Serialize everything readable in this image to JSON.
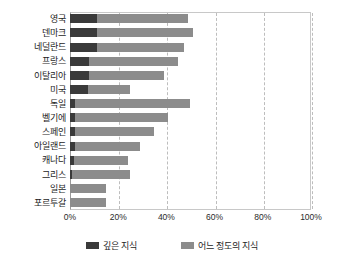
{
  "chart_data": {
    "type": "bar",
    "orientation": "horizontal",
    "stacked": true,
    "title": "",
    "subtitle": "",
    "xlabel": "",
    "ylabel": "",
    "xlim": [
      0,
      100
    ],
    "xticks": [
      "0%",
      "20%",
      "40%",
      "60%",
      "80%",
      "100%"
    ],
    "xtick_values": [
      0,
      20,
      40,
      60,
      80,
      100
    ],
    "grid": "vertical-dashed",
    "legend_position": "bottom",
    "categories": [
      "영국",
      "덴마크",
      "네덜란드",
      "프랑스",
      "이탈리아",
      "미국",
      "독일",
      "벨기에",
      "스페인",
      "아일랜드",
      "캐나다",
      "그리스",
      "일본",
      "포르투갈"
    ],
    "series": [
      {
        "name": "깊은 지식",
        "color": "#3a3a3a",
        "values": [
          11,
          11,
          11,
          8,
          8,
          7.5,
          2,
          2,
          2,
          2,
          1.5,
          1,
          0,
          0
        ]
      },
      {
        "name": "어느 정도의 지식",
        "color": "#8c8c8c",
        "values": [
          38,
          40,
          36.5,
          37,
          31,
          17.5,
          48,
          38.5,
          33,
          27,
          22.5,
          24,
          15,
          15
        ]
      }
    ],
    "totals": [
      49,
      51,
      47.5,
      45,
      39,
      25,
      50,
      40.5,
      35,
      29,
      24,
      25,
      15,
      15
    ]
  },
  "legend": {
    "items": [
      {
        "label": "깊은 지식",
        "swatch": "legend-swatch-deep"
      },
      {
        "label": "어느 정도의 지식",
        "swatch": "legend-swatch-some"
      }
    ]
  },
  "colors": {
    "deep": "#3a3a3a",
    "some": "#8c8c8c",
    "grid": "#bdbdbd",
    "frame": "#c8c8c8",
    "background": "#ffffff"
  }
}
